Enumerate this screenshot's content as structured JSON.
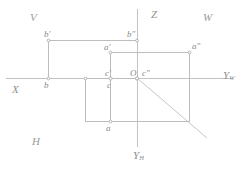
{
  "figure": {
    "type": "descriptive-geometry-three-plane-projection",
    "background": "#ffffff",
    "line_color": "#b9b9b9",
    "label_color": "#8c8c8c"
  },
  "planes": {
    "v": "V",
    "w": "W",
    "h": "H"
  },
  "axes": {
    "x": "X",
    "z": "Z",
    "y_w_letter": "Y",
    "y_w_sub": "W",
    "y_h_letter": "Y",
    "y_h_sub": "H",
    "origin": "O"
  },
  "points": {
    "b_prime": "b'",
    "b_double": "b\"",
    "a_prime": "a'",
    "a_double": "a\"",
    "c_prime": "c'",
    "c_double": "c\"",
    "c": "c",
    "b": "b",
    "a": "a"
  },
  "geometry": {
    "origin_px": [
      137,
      78
    ],
    "x_axis": [
      6,
      78,
      137,
      78
    ],
    "yw_axis": [
      137,
      78,
      232,
      78
    ],
    "z_axis": [
      137,
      10,
      137,
      78
    ],
    "yh_axis": [
      137,
      78,
      137,
      146
    ],
    "bisector": [
      137,
      78,
      207,
      137
    ],
    "rect_v": [
      48,
      40,
      137,
      78
    ],
    "rect_w": [
      137,
      52,
      190,
      78
    ],
    "seg_a_prime": [
      110,
      52,
      137,
      52
    ],
    "vline_a_prime": [
      110,
      52,
      110,
      78
    ],
    "rect_h": [
      85,
      78,
      190,
      122
    ],
    "vline_b": [
      48,
      40,
      48,
      78
    ],
    "vline_c": [
      85,
      78,
      85,
      122
    ]
  }
}
